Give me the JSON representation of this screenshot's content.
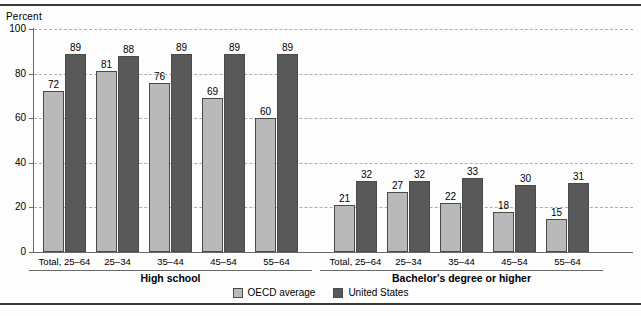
{
  "chart_data": {
    "type": "bar",
    "title": "",
    "ylabel": "Percent",
    "xlabel": "",
    "ylim": [
      0,
      100
    ],
    "yticks": [
      0,
      20,
      40,
      60,
      80,
      100
    ],
    "grid": true,
    "legend_position": "bottom-center",
    "categories": [
      "Total, 25–64",
      "25–34",
      "35–44",
      "45–54",
      "55–64",
      "Total, 25–64",
      "25–34",
      "35–44",
      "45–54",
      "55–64"
    ],
    "groups": [
      {
        "label": "High school",
        "categories": [
          "Total, 25–64",
          "25–34",
          "35–44",
          "45–54",
          "55–64"
        ],
        "series": [
          {
            "name": "OECD average",
            "values": [
              72,
              81,
              76,
              69,
              60
            ],
            "color": "#b9b9b9"
          },
          {
            "name": "United States",
            "values": [
              89,
              88,
              89,
              89,
              89
            ],
            "color": "#595959"
          }
        ]
      },
      {
        "label": "Bachelor's degree or higher",
        "categories": [
          "Total, 25–64",
          "25–34",
          "35–44",
          "45–54",
          "55–64"
        ],
        "series": [
          {
            "name": "OECD average",
            "values": [
              21,
              27,
              22,
              18,
              15
            ],
            "color": "#b9b9b9"
          },
          {
            "name": "United States",
            "values": [
              32,
              32,
              33,
              30,
              31
            ],
            "color": "#595959"
          }
        ]
      }
    ],
    "series": [
      {
        "name": "OECD average",
        "values": [
          72,
          81,
          76,
          69,
          60,
          21,
          27,
          22,
          18,
          15
        ],
        "color": "#b9b9b9"
      },
      {
        "name": "United States",
        "values": [
          89,
          88,
          89,
          89,
          89,
          32,
          32,
          33,
          30,
          31
        ],
        "color": "#595959"
      }
    ]
  },
  "legend": {
    "items": [
      {
        "label": "OECD average",
        "key": "oecd"
      },
      {
        "label": "United States",
        "key": "us"
      }
    ]
  }
}
